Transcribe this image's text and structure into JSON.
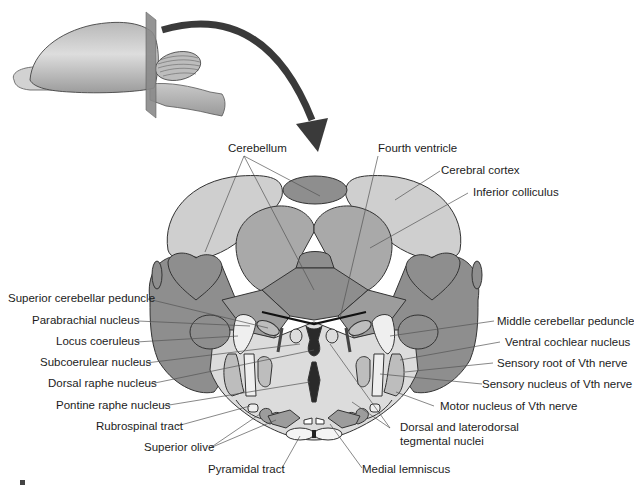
{
  "figure": {
    "inset": {
      "description": "Lateral view of rodent brain with transverse section plane through pons/cerebellum",
      "arrow": "curved-arrow-pointing-to-section"
    },
    "labels_top": [
      {
        "id": "cerebellum",
        "text": "Cerebellum"
      },
      {
        "id": "fourth-ventricle",
        "text": "Fourth ventricle"
      },
      {
        "id": "cerebral-cortex",
        "text": "Cerebral cortex"
      },
      {
        "id": "inferior-colliculus",
        "text": "Inferior colliculus"
      }
    ],
    "labels_left": [
      {
        "id": "superior-cerebellar-peduncle",
        "text": "Superior cerebellar peduncle"
      },
      {
        "id": "parabrachial-nucleus",
        "text": "Parabrachial nucleus"
      },
      {
        "id": "locus-coeruleus",
        "text": "Locus coeruleus"
      },
      {
        "id": "subcoerulear-nucleus",
        "text": "Subcoerulear nucleus"
      },
      {
        "id": "dorsal-raphe-nucleus",
        "text": "Dorsal raphe nucleus"
      },
      {
        "id": "pontine-raphe-nucleus",
        "text": "Pontine raphe nucleus"
      },
      {
        "id": "rubrospinal-tract",
        "text": "Rubrospinal tract"
      },
      {
        "id": "superior-olive",
        "text": "Superior olive"
      },
      {
        "id": "pyramidal-tract",
        "text": "Pyramidal tract"
      }
    ],
    "labels_right": [
      {
        "id": "middle-cerebellar-peduncle",
        "text": "Middle cerebellar peduncle"
      },
      {
        "id": "ventral-cochlear-nucleus",
        "text": "Ventral cochlear nucleus"
      },
      {
        "id": "sensory-root-vth",
        "text": "Sensory root of Vth nerve"
      },
      {
        "id": "sensory-nucleus-vth",
        "text": "Sensory nucleus of Vth nerve"
      },
      {
        "id": "motor-nucleus-vth",
        "text": "Motor nucleus of Vth nerve"
      },
      {
        "id": "dorsal-laterodorsal-line1",
        "text": "Dorsal and laterodorsal"
      },
      {
        "id": "dorsal-laterodorsal-line2",
        "text": "tegmental nuclei"
      },
      {
        "id": "medial-lemniscus",
        "text": "Medial lemniscus"
      }
    ],
    "colors": {
      "cortex_light": "#cfcfcf",
      "colliculus_mid": "#a9a9a9",
      "cerebellum_dark": "#8e8e8e",
      "pons_light": "#dcdcdc",
      "white_matter": "#efefef",
      "ventricle_black": "#2a2a2a",
      "outline": "#333333",
      "arrow": "#3a3a3a"
    }
  }
}
